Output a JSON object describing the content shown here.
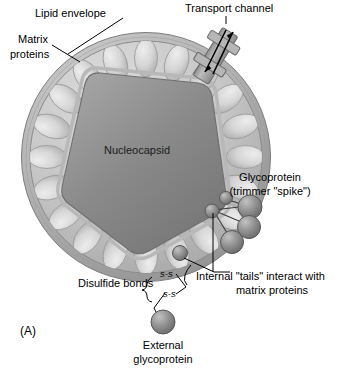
{
  "figure": {
    "panel_label": "(A)",
    "title_implicit": "Enveloped virus particle structure",
    "background_color": "#ffffff"
  },
  "labels": {
    "lipid_envelope": "Lipid envelope",
    "matrix_proteins_line1": "Matrix",
    "matrix_proteins_line2": "proteins",
    "transport_channel": "Transport channel",
    "nucleocapsid": "Nucleocapsid",
    "glycoprotein_line1": "Glycoprotein",
    "glycoprotein_line2": "(trimmer \"spike\")",
    "internal_tails_line1": "Internal \"tails\" interact with",
    "internal_tails_line2": "matrix proteins",
    "disulfide_bonds": "Disulfide bonds",
    "ss_bond_1": "s-s",
    "ss_bond_2": "s-s",
    "external_glycoprotein_line1": "External",
    "external_glycoprotein_line2": "glycoprotein"
  },
  "colors": {
    "envelope_outer": "#b9b9b9",
    "envelope_mid": "#9a9a9a",
    "envelope_inner_lumen": "#c9c9c9",
    "matrix_protein_fill": "#d6d6d6",
    "matrix_protein_edge": "#9d9d9d",
    "nucleocapsid_fill": "#8b8b8b",
    "nucleocapsid_edge": "#6f6f6f",
    "capsid_membrane": "#b2b2b2",
    "glycoprotein_sphere": "#8d8d8d",
    "glycoprotein_sphere_edge": "#5a5a5a",
    "channel_fill": "#a6a6a6",
    "channel_edge": "#6a6a6a",
    "line_color": "#000000",
    "text_color": "#000000"
  },
  "geometry": {
    "virion_center_x": 146,
    "virion_center_y": 157,
    "virion_radius": 125,
    "envelope_thickness": 10,
    "matrix_protein_count": 20,
    "trimer_sphere_count": 3,
    "tail_sphere_count": 2,
    "transport_channel_angle_deg": -32
  },
  "structures": [
    {
      "name": "lipid-envelope",
      "description": "Outer bilayer ring of the virion"
    },
    {
      "name": "matrix-protein-ring",
      "description": "Ring of ovoid matrix proteins beneath the envelope"
    },
    {
      "name": "nucleocapsid",
      "description": "Central hexagonal nucleocapsid core"
    },
    {
      "name": "transport-channel",
      "description": "Membrane-spanning channel with bidirectional arrows"
    },
    {
      "name": "glycoprotein-trimer",
      "description": "Three external spheres forming a spike trimer"
    },
    {
      "name": "disulfide-bonds",
      "description": "Two s-s linkages joining external glycoprotein"
    },
    {
      "name": "external-glycoprotein",
      "description": "Single detached glycoprotein sphere"
    }
  ]
}
